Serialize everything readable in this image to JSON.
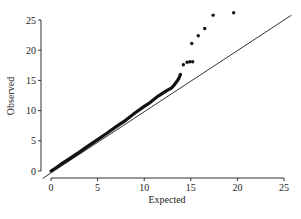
{
  "chart_data": {
    "type": "scatter",
    "title": "",
    "xlabel": "Expected",
    "ylabel": "Observed",
    "xlim": [
      0,
      25
    ],
    "ylim": [
      0,
      25
    ],
    "xticks": [
      0,
      5,
      10,
      15,
      20,
      25
    ],
    "yticks": [
      0,
      5,
      10,
      15,
      20,
      25
    ],
    "grid": false,
    "legend": null,
    "reference_line": {
      "label": "y = x",
      "from": [
        0,
        0
      ],
      "to": [
        25,
        25
      ]
    },
    "series": [
      {
        "name": "Q-Q points",
        "dense_band": {
          "x_from": 0,
          "x_to": 10.5,
          "description": "dense points closely following y≈1.03x"
        },
        "points": [
          [
            0,
            0
          ],
          [
            0.5,
            0.5
          ],
          [
            1,
            1.05
          ],
          [
            2,
            2.05
          ],
          [
            3,
            3.1
          ],
          [
            4,
            4.15
          ],
          [
            5,
            5.2
          ],
          [
            6,
            6.25
          ],
          [
            7,
            7.35
          ],
          [
            8,
            8.4
          ],
          [
            9,
            9.6
          ],
          [
            10,
            10.7
          ],
          [
            10.5,
            11.2
          ],
          [
            11,
            11.8
          ],
          [
            11.5,
            12.4
          ],
          [
            12,
            12.9
          ],
          [
            12.5,
            13.4
          ],
          [
            12.9,
            13.7
          ],
          [
            13.2,
            14.2
          ],
          [
            13.5,
            14.8
          ],
          [
            13.7,
            15.3
          ],
          [
            13.9,
            16.0
          ],
          [
            14.2,
            17.6
          ],
          [
            14.6,
            18.0
          ],
          [
            14.9,
            18.1
          ],
          [
            15.2,
            18.1
          ],
          [
            15.1,
            21.1
          ],
          [
            15.8,
            22.4
          ],
          [
            16.5,
            23.6
          ],
          [
            17.4,
            25.8
          ],
          [
            19.6,
            26.2
          ]
        ]
      }
    ]
  },
  "axes": {
    "x_tick_labels": [
      "0",
      "5",
      "10",
      "15",
      "20",
      "25"
    ],
    "y_tick_labels": [
      "0",
      "5",
      "10",
      "15",
      "20",
      "25"
    ]
  }
}
